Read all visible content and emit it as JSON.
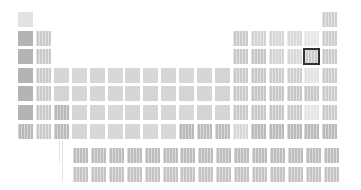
{
  "view": {
    "title": "Periodic table heatmap",
    "grid": {
      "origin_x": 18,
      "origin_y": 12,
      "col_pitch": 17.9,
      "row_pitch": 18.6,
      "cell_size": 15,
      "f_block_origin_x": 73,
      "lanthanide_y": 148,
      "actinide_y": 167
    },
    "selected": {
      "period": 3,
      "group": 17
    },
    "colors": {
      "selected_border": "#333333",
      "connector": "#e4e4e4"
    }
  },
  "cells": [
    {
      "p": 1,
      "g": 1,
      "c": "#e2e2e2",
      "s": 0
    },
    {
      "p": 1,
      "g": 18,
      "c": "#cfcfcf",
      "s": 1
    },
    {
      "p": 2,
      "g": 1,
      "c": "#b4b4b4",
      "s": 0
    },
    {
      "p": 2,
      "g": 2,
      "c": "#cacaca",
      "s": 1
    },
    {
      "p": 2,
      "g": 13,
      "c": "#cacaca",
      "s": 1
    },
    {
      "p": 2,
      "g": 14,
      "c": "#d3d3d3",
      "s": 1
    },
    {
      "p": 2,
      "g": 15,
      "c": "#d6d6d6",
      "s": 1
    },
    {
      "p": 2,
      "g": 16,
      "c": "#d9d9d9",
      "s": 1
    },
    {
      "p": 2,
      "g": 17,
      "c": "#e6e6e6",
      "s": 1
    },
    {
      "p": 2,
      "g": 18,
      "c": "#cdcdcd",
      "s": 1
    },
    {
      "p": 3,
      "g": 1,
      "c": "#b4b4b4",
      "s": 0
    },
    {
      "p": 3,
      "g": 2,
      "c": "#cacaca",
      "s": 1
    },
    {
      "p": 3,
      "g": 13,
      "c": "#c8c8c8",
      "s": 1
    },
    {
      "p": 3,
      "g": 14,
      "c": "#c6c6c6",
      "s": 1
    },
    {
      "p": 3,
      "g": 15,
      "c": "#d4d4d4",
      "s": 1
    },
    {
      "p": 3,
      "g": 16,
      "c": "#d8d8d8",
      "s": 1
    },
    {
      "p": 3,
      "g": 17,
      "c": "#cccccc",
      "s": 1
    },
    {
      "p": 3,
      "g": 18,
      "c": "#cccccc",
      "s": 1
    },
    {
      "p": 4,
      "g": 1,
      "c": "#b4b4b4",
      "s": 0
    },
    {
      "p": 4,
      "g": 2,
      "c": "#cacaca",
      "s": 1
    },
    {
      "p": 4,
      "g": 3,
      "c": "#d6d6d6",
      "s": 0
    },
    {
      "p": 4,
      "g": 4,
      "c": "#d8d8d8",
      "s": 0
    },
    {
      "p": 4,
      "g": 5,
      "c": "#d6d6d6",
      "s": 0
    },
    {
      "p": 4,
      "g": 6,
      "c": "#d8d8d8",
      "s": 0
    },
    {
      "p": 4,
      "g": 7,
      "c": "#d6d6d6",
      "s": 0
    },
    {
      "p": 4,
      "g": 8,
      "c": "#d8d8d8",
      "s": 0
    },
    {
      "p": 4,
      "g": 9,
      "c": "#d6d6d6",
      "s": 0
    },
    {
      "p": 4,
      "g": 10,
      "c": "#d8d8d8",
      "s": 0
    },
    {
      "p": 4,
      "g": 11,
      "c": "#d6d6d6",
      "s": 0
    },
    {
      "p": 4,
      "g": 12,
      "c": "#d4d4d4",
      "s": 0
    },
    {
      "p": 4,
      "g": 13,
      "c": "#cacaca",
      "s": 1
    },
    {
      "p": 4,
      "g": 14,
      "c": "#c8c8c8",
      "s": 1
    },
    {
      "p": 4,
      "g": 15,
      "c": "#cccccc",
      "s": 1
    },
    {
      "p": 4,
      "g": 16,
      "c": "#cfcfcf",
      "s": 1
    },
    {
      "p": 4,
      "g": 17,
      "c": "#e2e2e2",
      "s": 1
    },
    {
      "p": 4,
      "g": 18,
      "c": "#cccccc",
      "s": 1
    },
    {
      "p": 5,
      "g": 1,
      "c": "#b4b4b4",
      "s": 0
    },
    {
      "p": 5,
      "g": 2,
      "c": "#cacaca",
      "s": 1
    },
    {
      "p": 5,
      "g": 3,
      "c": "#d4d4d4",
      "s": 0
    },
    {
      "p": 5,
      "g": 4,
      "c": "#d6d6d6",
      "s": 0
    },
    {
      "p": 5,
      "g": 5,
      "c": "#d6d6d6",
      "s": 0
    },
    {
      "p": 5,
      "g": 6,
      "c": "#d6d6d6",
      "s": 0
    },
    {
      "p": 5,
      "g": 7,
      "c": "#d6d6d6",
      "s": 0
    },
    {
      "p": 5,
      "g": 8,
      "c": "#d4d4d4",
      "s": 0
    },
    {
      "p": 5,
      "g": 9,
      "c": "#d6d6d6",
      "s": 0
    },
    {
      "p": 5,
      "g": 10,
      "c": "#d4d4d4",
      "s": 0
    },
    {
      "p": 5,
      "g": 11,
      "c": "#d6d6d6",
      "s": 0
    },
    {
      "p": 5,
      "g": 12,
      "c": "#d4d4d4",
      "s": 0
    },
    {
      "p": 5,
      "g": 13,
      "c": "#cacaca",
      "s": 1
    },
    {
      "p": 5,
      "g": 14,
      "c": "#c6c6c6",
      "s": 1
    },
    {
      "p": 5,
      "g": 15,
      "c": "#c8c8c8",
      "s": 1
    },
    {
      "p": 5,
      "g": 16,
      "c": "#c6c6c6",
      "s": 1
    },
    {
      "p": 5,
      "g": 17,
      "c": "#c8c8c8",
      "s": 1
    },
    {
      "p": 5,
      "g": 18,
      "c": "#cccccc",
      "s": 1
    },
    {
      "p": 6,
      "g": 1,
      "c": "#b4b4b4",
      "s": 0
    },
    {
      "p": 6,
      "g": 2,
      "c": "#cacaca",
      "s": 1
    },
    {
      "p": 6,
      "g": 3,
      "c": "#b8b8b8",
      "s": 1
    },
    {
      "p": 6,
      "g": 4,
      "c": "#d6d6d6",
      "s": 0
    },
    {
      "p": 6,
      "g": 5,
      "c": "#d6d6d6",
      "s": 0
    },
    {
      "p": 6,
      "g": 6,
      "c": "#d8d8d8",
      "s": 0
    },
    {
      "p": 6,
      "g": 7,
      "c": "#d6d6d6",
      "s": 0
    },
    {
      "p": 6,
      "g": 8,
      "c": "#d6d6d6",
      "s": 0
    },
    {
      "p": 6,
      "g": 9,
      "c": "#d6d6d6",
      "s": 0
    },
    {
      "p": 6,
      "g": 10,
      "c": "#d8d8d8",
      "s": 0
    },
    {
      "p": 6,
      "g": 11,
      "c": "#d4d4d4",
      "s": 0
    },
    {
      "p": 6,
      "g": 12,
      "c": "#d6d6d6",
      "s": 0
    },
    {
      "p": 6,
      "g": 13,
      "c": "#cacaca",
      "s": 1
    },
    {
      "p": 6,
      "g": 14,
      "c": "#c8c8c8",
      "s": 1
    },
    {
      "p": 6,
      "g": 15,
      "c": "#c8c8c8",
      "s": 1
    },
    {
      "p": 6,
      "g": 16,
      "c": "#cccccc",
      "s": 1
    },
    {
      "p": 6,
      "g": 17,
      "c": "#e4e4e4",
      "s": 1
    },
    {
      "p": 6,
      "g": 18,
      "c": "#cccccc",
      "s": 1
    },
    {
      "p": 7,
      "g": 1,
      "c": "#b8b8b8",
      "s": 1
    },
    {
      "p": 7,
      "g": 2,
      "c": "#cacaca",
      "s": 1
    },
    {
      "p": 7,
      "g": 3,
      "c": "#bababa",
      "s": 1
    },
    {
      "p": 7,
      "g": 4,
      "c": "#d6d6d6",
      "s": 0
    },
    {
      "p": 7,
      "g": 5,
      "c": "#d8d8d8",
      "s": 0
    },
    {
      "p": 7,
      "g": 6,
      "c": "#d8d8d8",
      "s": 0
    },
    {
      "p": 7,
      "g": 7,
      "c": "#d6d6d6",
      "s": 0
    },
    {
      "p": 7,
      "g": 8,
      "c": "#d8d8d8",
      "s": 0
    },
    {
      "p": 7,
      "g": 9,
      "c": "#d8d8d8",
      "s": 0
    },
    {
      "p": 7,
      "g": 10,
      "c": "#b8b8b8",
      "s": 1
    },
    {
      "p": 7,
      "g": 11,
      "c": "#bcbcbc",
      "s": 1
    },
    {
      "p": 7,
      "g": 12,
      "c": "#bcbcbc",
      "s": 1
    },
    {
      "p": 7,
      "g": 13,
      "c": "#d8d8d8",
      "s": 1
    },
    {
      "p": 7,
      "g": 14,
      "c": "#bababa",
      "s": 1
    },
    {
      "p": 7,
      "g": 15,
      "c": "#bababa",
      "s": 1
    },
    {
      "p": 7,
      "g": 16,
      "c": "#bababa",
      "s": 1
    },
    {
      "p": 7,
      "g": 17,
      "c": "#bababa",
      "s": 1
    },
    {
      "p": 7,
      "g": 18,
      "c": "#bababa",
      "s": 1
    }
  ],
  "lanthanides": [
    "#bdbdbd",
    "#bdbdbd",
    "#bdbdbd",
    "#bdbdbd",
    "#bdbdbd",
    "#bdbdbd",
    "#bdbdbd",
    "#bdbdbd",
    "#bdbdbd",
    "#bdbdbd",
    "#bdbdbd",
    "#bdbdbd",
    "#bdbdbd",
    "#bdbdbd",
    "#bdbdbd"
  ],
  "actinides": [
    "#c4c4c4",
    "#c4c4c4",
    "#c4c4c4",
    "#c4c4c4",
    "#c4c4c4",
    "#c4c4c4",
    "#c4c4c4",
    "#c4c4c4",
    "#c4c4c4",
    "#c4c4c4",
    "#c4c4c4",
    "#c4c4c4",
    "#c4c4c4",
    "#c4c4c4",
    "#c4c4c4"
  ]
}
